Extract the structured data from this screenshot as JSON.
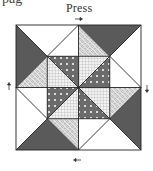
{
  "page": {
    "cutoff_text": "pag",
    "label": "Press"
  },
  "diagram": {
    "block": {
      "x": 16,
      "y": 25,
      "size": 125
    },
    "arrows": [
      {
        "position": "top",
        "direction": "right"
      },
      {
        "position": "left",
        "direction": "up"
      },
      {
        "position": "right",
        "direction": "down"
      },
      {
        "position": "bottom",
        "direction": "left"
      }
    ],
    "fabrics": {
      "dark": "#5a5a5a",
      "light": "#ffffff",
      "dots": "#6b6b6b",
      "grid": "#e6e6e6",
      "lace": "#d9d9d9"
    },
    "line_color": "#222222"
  }
}
